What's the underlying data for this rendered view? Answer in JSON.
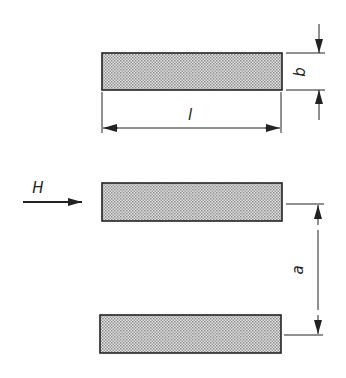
{
  "diagram": {
    "title": "",
    "labels": {
      "field": "H",
      "length": "l",
      "width": "b",
      "spacing": "a"
    },
    "colors": {
      "stroke": "#222222",
      "fill": "#c8c8c8",
      "background": "#ffffff"
    },
    "strips": [
      {
        "id": "top-strip"
      },
      {
        "id": "middle-strip"
      },
      {
        "id": "bottom-strip"
      }
    ]
  }
}
